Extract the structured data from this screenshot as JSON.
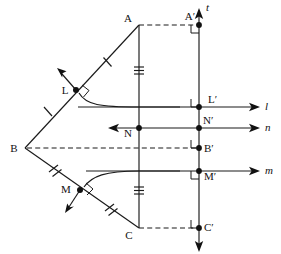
{
  "figure": {
    "background_color": "#ffffff",
    "ink_color": "#1a1a1a",
    "width": 281,
    "height": 254
  },
  "points": [
    {
      "id": "A",
      "label": "A",
      "x": 139,
      "y": 25,
      "label_dx": -11,
      "label_dy": -3,
      "dot": false
    },
    {
      "id": "Ap",
      "label": "A′",
      "x": 199,
      "y": 25,
      "label_dx": -13,
      "label_dy": -5,
      "dot": true
    },
    {
      "id": "L",
      "label": "L",
      "x": 76,
      "y": 90,
      "label_dx": -12,
      "label_dy": 4,
      "dot": true
    },
    {
      "id": "Lp",
      "label": "L′",
      "x": 199,
      "y": 107,
      "label_dx": 4,
      "label_dy": -4,
      "dot": true
    },
    {
      "id": "N",
      "label": "N",
      "x": 139,
      "y": 128,
      "label_dx": -12,
      "label_dy": 9,
      "dot": true
    },
    {
      "id": "Np",
      "label": "N′",
      "x": 199,
      "y": 128,
      "label_dx": 3,
      "label_dy": -4,
      "dot": true
    },
    {
      "id": "B",
      "label": "B",
      "x": 25,
      "y": 148,
      "label_dx": -12,
      "label_dy": 4,
      "dot": false
    },
    {
      "id": "Bp",
      "label": "B′",
      "x": 199,
      "y": 148,
      "label_dx": 4,
      "label_dy": 4,
      "dot": true
    },
    {
      "id": "M",
      "label": "M",
      "x": 80,
      "y": 190,
      "label_dx": -15,
      "label_dy": 3,
      "dot": true
    },
    {
      "id": "Mp",
      "label": "M′",
      "x": 199,
      "y": 171,
      "label_dx": 4,
      "label_dy": 9,
      "dot": true
    },
    {
      "id": "C",
      "label": "C",
      "x": 139,
      "y": 228,
      "label_dx": -11,
      "label_dy": 9,
      "dot": false
    },
    {
      "id": "Cp",
      "label": "C′",
      "x": 199,
      "y": 228,
      "label_dx": 4,
      "label_dy": 3,
      "dot": true
    }
  ],
  "lines": [
    {
      "id": "t",
      "label": "t",
      "label_x": 206,
      "label_y": 11,
      "orientation": "vertical",
      "arrows": "both",
      "note": "axis of reflection"
    },
    {
      "id": "l",
      "label": "l",
      "label_x": 265,
      "label_y": 108,
      "orientation": "horizontal",
      "arrows": "right",
      "through": "L-prime"
    },
    {
      "id": "n",
      "label": "n",
      "label_x": 265,
      "label_y": 131,
      "orientation": "horizontal",
      "arrows": "both",
      "through": "N and N-prime"
    },
    {
      "id": "m",
      "label": "m",
      "label_x": 265,
      "label_y": 172,
      "orientation": "horizontal",
      "arrows": "right",
      "through": "M-prime"
    }
  ],
  "segments": [
    {
      "id": "BA",
      "from": "B",
      "to": "A",
      "style": "solid",
      "ticks": 1
    },
    {
      "id": "BC",
      "from": "B",
      "to": "C",
      "style": "solid",
      "ticks": 2
    },
    {
      "id": "AN",
      "from": "A",
      "to": "N",
      "style": "solid",
      "ticks": 3
    },
    {
      "id": "NC",
      "from": "N",
      "to": "C",
      "style": "solid",
      "ticks": 3
    },
    {
      "id": "AAp",
      "from": "A",
      "to": "A′",
      "style": "dashed",
      "ticks": 0
    },
    {
      "id": "BBp",
      "from": "B",
      "to": "B′",
      "style": "dashed",
      "ticks": 0
    },
    {
      "id": "CCp",
      "from": "C",
      "to": "C′",
      "style": "dashed",
      "ticks": 0
    }
  ],
  "curves": [
    {
      "id": "curve-L",
      "from": "L",
      "to": "line-l",
      "note": "arc from L sweeping to line l"
    },
    {
      "id": "curve-M",
      "from": "M",
      "to": "line-m",
      "note": "arc from M sweeping to line m"
    }
  ],
  "right_angle_marks": [
    {
      "at": "A′",
      "note": "between dashed AA′ and line t"
    },
    {
      "at": "L",
      "note": "between BA and the arc direction"
    },
    {
      "at": "L′",
      "note": "between line l and line t"
    },
    {
      "at": "B′",
      "note": "between dashed BB′ and line t"
    },
    {
      "at": "M",
      "note": "between BC and the arc direction"
    },
    {
      "at": "M′",
      "note": "between line m and line t"
    },
    {
      "at": "C′",
      "note": "between dashed CC′ and line t"
    }
  ],
  "direction_arrows": [
    {
      "at": "L",
      "direction": "up-left",
      "note": "normal direction at L"
    },
    {
      "at": "M",
      "direction": "down-left",
      "note": "normal direction at M"
    }
  ]
}
